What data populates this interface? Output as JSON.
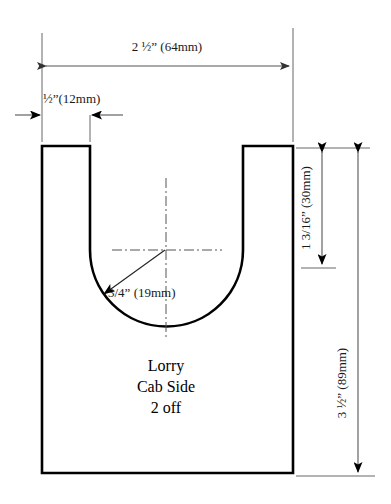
{
  "drawing": {
    "title_lines": [
      "Lorry",
      "Cab Side",
      "2 off"
    ],
    "part_name": "Lorry Cab Side",
    "quantity_note": "2 off",
    "dimensions": {
      "overall_width": "2 ½” (64mm)",
      "side_strip_width": "½”(12mm)",
      "notch_depth": "1 3/16” (30mm)",
      "overall_height": "3 ½” (89mm)",
      "notch_radius": "3/4” (19mm)"
    },
    "colors": {
      "outline": "#000000",
      "dimension_line": "#555555",
      "extension_line": "#666666",
      "center_line": "#555555",
      "background": "#ffffff",
      "text": "#1a1a1a"
    },
    "geometry": {
      "body_left": 42,
      "body_right": 293,
      "body_top": 146,
      "body_bottom": 473,
      "notch_left": 90,
      "notch_right": 243,
      "arc_center_x": 166,
      "arc_center_y": 250,
      "arc_radius": 77
    }
  }
}
